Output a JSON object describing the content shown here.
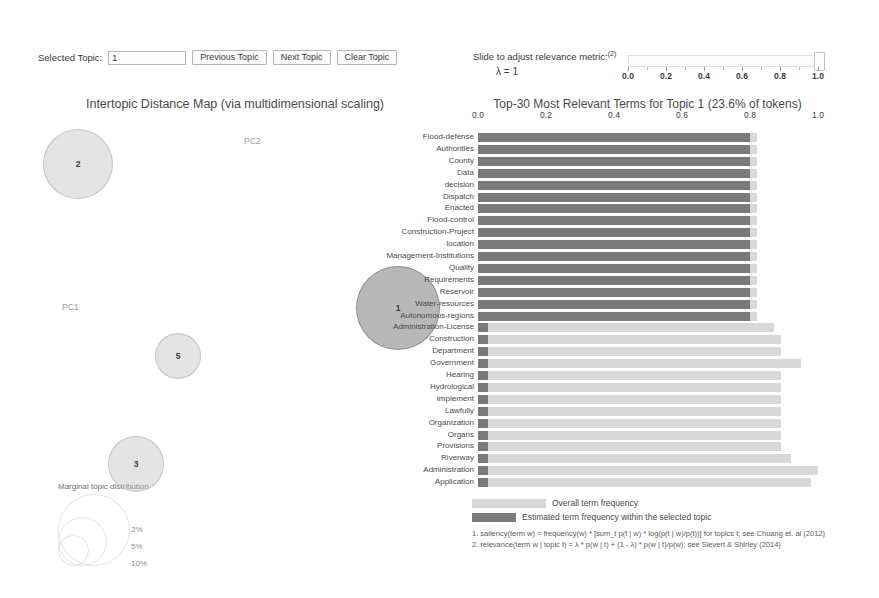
{
  "controls": {
    "selected_topic_label": "Selected Topic:",
    "selected_topic_value": "1",
    "previous_topic": "Previous Topic",
    "next_topic": "Next Topic",
    "clear_topic": "Clear Topic"
  },
  "lambda_slider": {
    "title": "Slide to adjust relevance metric:",
    "title_superscript": "(2)",
    "lambda_value": "λ = 1",
    "ticks": [
      "0.0",
      "0.2",
      "0.4",
      "0.6",
      "0.8",
      "1.0"
    ],
    "tick_values": [
      0.0,
      0.2,
      0.4,
      0.6,
      0.8,
      1.0
    ],
    "handle_value": 1.0,
    "min": 0.0,
    "max": 1.0
  },
  "map": {
    "title": "Intertopic Distance Map (via multidimensional scaling)",
    "x_axis_label": "PC1",
    "y_axis_label": "PC2",
    "marginal_title": "Marginal topic distribution",
    "size_legend": [
      "2%",
      "5%",
      "10%"
    ],
    "topics": [
      {
        "id": "1",
        "x": 362,
        "y": 196,
        "r": 42,
        "selected": true
      },
      {
        "id": "2",
        "x": 42,
        "y": 52,
        "r": 35,
        "selected": false
      },
      {
        "id": "5",
        "x": 142,
        "y": 244,
        "r": 23,
        "selected": false
      },
      {
        "id": "3",
        "x": 100,
        "y": 352,
        "r": 28,
        "selected": false
      }
    ]
  },
  "bar_panel": {
    "title": "Top-30 Most Relevant Terms for Topic 1 (23.6% of tokens)",
    "legend_overall": "Overall term frequency",
    "legend_topic": "Estimated term frequency within the selected topic",
    "footnote_1": "1. saliency(term w) = frequency(w) * [sum_t p(t | w) * log(p(t | w)/p(t))] for topics t; see Chuang et. al (2012)",
    "footnote_2": "2. relevance(term w | topic t) = λ * p(w | t) + (1 - λ) * p(w | t)/p(w); see Sievert & Shirley (2014)"
  },
  "chart_data": {
    "type": "bar",
    "title": "Top-30 Most Relevant Terms for Topic 1 (23.6% of tokens)",
    "orientation": "horizontal",
    "xlabel": "",
    "ylabel": "",
    "xlim": [
      0.0,
      1.0
    ],
    "xticks": [
      0.0,
      0.2,
      0.4,
      0.6,
      0.8,
      1.0
    ],
    "grid": false,
    "legend_position": "bottom-left",
    "categories": [
      "Flood-defense",
      "Authorities",
      "County",
      "Data",
      "decision",
      "Dispatch",
      "Enacted",
      "Flood-control",
      "Construction-Project",
      "location",
      "Management-Institutions",
      "Quality",
      "Requirements",
      "Reservoir",
      "Water-resources",
      "Autonomous-regions",
      "Administration-License",
      "Construction",
      "Department",
      "Government",
      "Hearing",
      "Hydrological",
      "Implement",
      "Lawfully",
      "Organization",
      "Organs",
      "Provisions",
      "Riverway",
      "Administration",
      "Application"
    ],
    "series": [
      {
        "name": "Overall term frequency",
        "color": "#d8d8d8",
        "values": [
          0.82,
          0.82,
          0.82,
          0.82,
          0.82,
          0.82,
          0.82,
          0.82,
          0.82,
          0.82,
          0.82,
          0.82,
          0.82,
          0.82,
          0.82,
          0.82,
          0.87,
          0.89,
          0.89,
          0.95,
          0.89,
          0.89,
          0.89,
          0.89,
          0.89,
          0.89,
          0.89,
          0.92,
          1.0,
          0.98
        ]
      },
      {
        "name": "Estimated term frequency within the selected topic",
        "color": "#7a7a7a",
        "values": [
          0.8,
          0.8,
          0.8,
          0.8,
          0.8,
          0.8,
          0.8,
          0.8,
          0.8,
          0.8,
          0.8,
          0.8,
          0.8,
          0.8,
          0.8,
          0.8,
          0.03,
          0.03,
          0.03,
          0.03,
          0.03,
          0.03,
          0.03,
          0.03,
          0.03,
          0.03,
          0.03,
          0.03,
          0.03,
          0.03
        ]
      }
    ]
  }
}
